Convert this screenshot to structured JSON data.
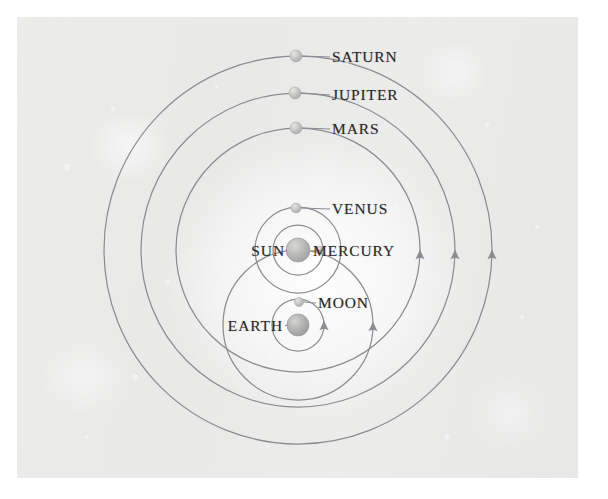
{
  "figure": {
    "background_color": "#ebebea",
    "orbit_color": "#8c8c93",
    "label_color": "#2b2b2b",
    "margin_color": "#ffffff"
  },
  "labels": {
    "saturn": "SATURN",
    "jupiter": "JUPITER",
    "mars": "MARS",
    "venus": "VENUS",
    "sun": "SUN",
    "mercury": "MERCURY",
    "moon": "MOON",
    "earth": "EARTH"
  },
  "chart_data": {
    "type": "diagram",
    "xlabel": "",
    "ylabel": "",
    "xlim": [
      0,
      561
    ],
    "ylim": [
      0,
      461
    ],
    "grid": false,
    "legend": "none",
    "centers": {
      "earth": {
        "x": 281,
        "y": 308
      },
      "sun": {
        "x": 281,
        "y": 233
      }
    },
    "bodies": [
      {
        "name": "SATURN",
        "label": "SATURN",
        "x": 279,
        "y": 39,
        "radius": 6.0,
        "label_x": 315,
        "label_y": 40,
        "label_side": "left",
        "orbits": "sun",
        "orbit_radius": 194,
        "orbit_center": "sun"
      },
      {
        "name": "JUPITER",
        "label": "JUPITER",
        "x": 278,
        "y": 76,
        "radius": 6.0,
        "label_x": 315,
        "label_y": 78,
        "label_side": "left",
        "orbits": "sun",
        "orbit_radius": 157,
        "orbit_center": "sun"
      },
      {
        "name": "MARS",
        "label": "MARS",
        "x": 279,
        "y": 111,
        "radius": 6.0,
        "label_x": 315,
        "label_y": 112,
        "label_side": "left",
        "orbits": "sun",
        "orbit_radius": 122,
        "orbit_center": "sun"
      },
      {
        "name": "VENUS",
        "label": "VENUS",
        "x": 279,
        "y": 191,
        "radius": 5.0,
        "label_x": 315,
        "label_y": 192,
        "label_side": "left",
        "orbits": "sun",
        "orbit_radius": 43,
        "orbit_center": "sun"
      },
      {
        "name": "MERCURY",
        "label": "MERCURY",
        "x": 303,
        "y": 233,
        "radius": 4.0,
        "label_x": 296,
        "label_y": 234,
        "label_side": "left",
        "orbits": "sun",
        "orbit_radius": 25,
        "orbit_center": "sun"
      },
      {
        "name": "SUN",
        "label": "SUN",
        "x": 281,
        "y": 233,
        "radius": 12.0,
        "label_x": 268,
        "label_y": 234,
        "label_side": "right",
        "orbits": "earth",
        "orbit_radius": 75,
        "orbit_center": "earth"
      },
      {
        "name": "MOON",
        "label": "MOON",
        "x": 282,
        "y": 285,
        "radius": 4.5,
        "label_x": 301,
        "label_y": 286,
        "label_side": "left",
        "orbits": "earth",
        "orbit_radius": 26,
        "orbit_center": "earth"
      },
      {
        "name": "EARTH",
        "label": "EARTH",
        "x": 281,
        "y": 308,
        "radius": 11.0,
        "label_x": 266,
        "label_y": 309,
        "label_side": "right",
        "orbits": "none",
        "orbit_radius": 0,
        "orbit_center": "none"
      }
    ],
    "orbit_circles": [
      {
        "name": "saturn-orbit",
        "cx": 281,
        "cy": 233,
        "r": 194
      },
      {
        "name": "jupiter-orbit",
        "cx": 281,
        "cy": 233,
        "r": 157
      },
      {
        "name": "mars-orbit",
        "cx": 281,
        "cy": 233,
        "r": 122
      },
      {
        "name": "venus-orbit",
        "cx": 281,
        "cy": 233,
        "r": 43
      },
      {
        "name": "mercury-orbit",
        "cx": 281,
        "cy": 233,
        "r": 25
      },
      {
        "name": "sun-orbit",
        "cx": 281,
        "cy": 308,
        "r": 75
      },
      {
        "name": "moon-orbit",
        "cx": 281,
        "cy": 308,
        "r": 26
      }
    ],
    "direction_arrows": [
      {
        "on": "mars-orbit",
        "x": 403,
        "y": 241,
        "angle": 0
      },
      {
        "on": "jupiter-orbit",
        "x": 438,
        "y": 241,
        "angle": 0
      },
      {
        "on": "saturn-orbit",
        "x": 475,
        "y": 241,
        "angle": 0
      },
      {
        "on": "sun-orbit",
        "x": 356,
        "y": 313,
        "angle": 0
      },
      {
        "on": "moon-orbit",
        "x": 307,
        "y": 312,
        "angle": 0
      }
    ]
  }
}
